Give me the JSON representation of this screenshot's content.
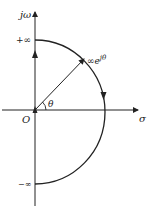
{
  "diagram": {
    "type": "nyquist-contour",
    "axis_labels": {
      "imaginary": "jω",
      "real": "σ",
      "origin": "O"
    },
    "tick_labels": {
      "top": "+∞",
      "bottom": "−∞"
    },
    "radius_label": {
      "base": "∞e",
      "superscript": "jθ"
    },
    "angle_label": "θ",
    "colors": {
      "stroke": "#222222",
      "background": "#ffffff"
    }
  }
}
